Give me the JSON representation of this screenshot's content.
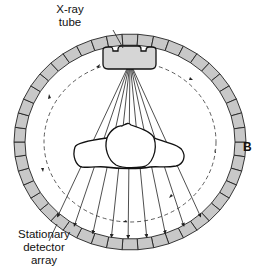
{
  "diagram": {
    "panel_label": "B",
    "labels": {
      "tube_line1": "X-ray",
      "tube_line2": "tube",
      "detector_line1": "Stationary",
      "detector_line2": "detector",
      "detector_line3": "array"
    },
    "components": [
      {
        "id": "xray-tube",
        "label": "X-ray tube"
      },
      {
        "id": "detector-ring",
        "label": "Stationary detector array"
      },
      {
        "id": "tube-rotation-path",
        "label": "dashed circular path (tube rotation)"
      },
      {
        "id": "patient-cross-section",
        "label": "patient cross-section"
      },
      {
        "id": "xray-fan-beam",
        "label": "fan of x-ray beams"
      }
    ],
    "colors": {
      "detector_fill": "#c8c8c8",
      "tube_fill": "#d4d4d4",
      "stroke": "#222222"
    }
  }
}
